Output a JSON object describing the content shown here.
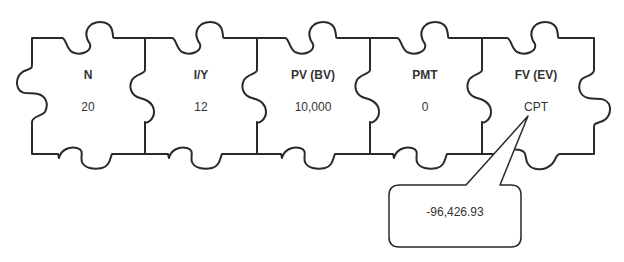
{
  "diagram": {
    "type": "puzzle-calculator-keys",
    "pieces": [
      {
        "label": "N",
        "value": "20"
      },
      {
        "label": "I/Y",
        "value": "12"
      },
      {
        "label": "PV (BV)",
        "value": "10,000"
      },
      {
        "label": "PMT",
        "value": "0"
      },
      {
        "label": "FV (EV)",
        "value": "CPT"
      }
    ],
    "callout": {
      "points_to": "FV (EV)",
      "text": "-96,426.93"
    },
    "colors": {
      "stroke": "#2a2a2a",
      "text": "#333333",
      "background": "#ffffff"
    }
  }
}
